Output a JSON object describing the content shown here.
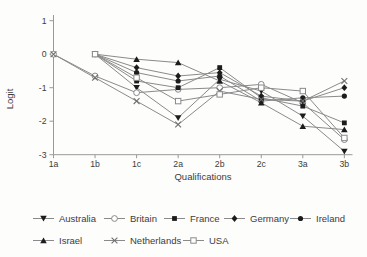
{
  "figure_title": "",
  "chart_data": {
    "type": "line",
    "title": "",
    "xlabel": "Qualifications",
    "ylabel": "Logit",
    "categories": [
      "1a",
      "1b",
      "1c",
      "2a",
      "2b",
      "2c",
      "3a",
      "3b"
    ],
    "y_ticks": [
      1,
      0,
      -1,
      -2,
      -3
    ],
    "ylim": [
      -3,
      1
    ],
    "grid": false,
    "legend_position": "bottom",
    "series": [
      {
        "name": "Australia",
        "marker": "triangle-down",
        "values": [
          null,
          0,
          -1.0,
          -1.9,
          -0.75,
          -1.1,
          -1.85,
          -2.9
        ]
      },
      {
        "name": "Britain",
        "marker": "circle-open",
        "values": [
          0,
          -0.65,
          -1.15,
          -1.05,
          -1.0,
          -0.9,
          -1.45,
          -2.55
        ]
      },
      {
        "name": "France",
        "marker": "square-filled",
        "values": [
          null,
          0,
          -0.8,
          -1.0,
          -0.4,
          -1.3,
          -1.55,
          -2.05
        ]
      },
      {
        "name": "Germany",
        "marker": "diamond-filled",
        "values": [
          null,
          0,
          -0.4,
          -0.65,
          -0.55,
          -1.25,
          -1.4,
          -1.0
        ]
      },
      {
        "name": "Ireland",
        "marker": "circle-filled",
        "values": [
          null,
          0,
          -0.55,
          -0.8,
          -0.65,
          -1.4,
          -1.3,
          -1.25
        ]
      },
      {
        "name": "Israel",
        "marker": "triangle-up",
        "values": [
          null,
          0,
          -0.15,
          -0.25,
          -0.8,
          -1.45,
          -2.15,
          -2.25
        ]
      },
      {
        "name": "Netherlands",
        "marker": "x-cross",
        "values": [
          0,
          -0.7,
          -1.4,
          -2.1,
          -1.1,
          -1.35,
          -1.4,
          -0.8
        ]
      },
      {
        "name": "USA",
        "marker": "square-open",
        "values": [
          null,
          0,
          -0.7,
          -1.4,
          -1.2,
          -1.0,
          -1.1,
          -2.5
        ]
      }
    ]
  },
  "colors": {
    "background": "#fdfdfc",
    "axis": "#999999",
    "line": "#8a8a8a",
    "marker_fill": "#1c1c1c",
    "open_marker_stroke": "#8a8a8a",
    "text": "#3c3c3c"
  }
}
